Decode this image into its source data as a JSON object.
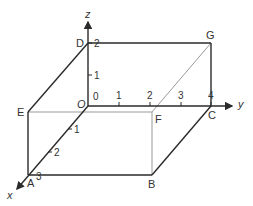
{
  "diagram": {
    "type": "3d-cuboid-axes",
    "axes": {
      "x": {
        "label": "x",
        "ticks": [
          "1",
          "2",
          "3"
        ]
      },
      "y": {
        "label": "y",
        "ticks": [
          "1",
          "2",
          "3",
          "4"
        ]
      },
      "z": {
        "label": "z",
        "ticks": [
          "1",
          "2"
        ]
      },
      "origin_label": "O",
      "origin_tick": "0"
    },
    "vertices": {
      "O": "O",
      "A": "A",
      "B": "B",
      "C": "C",
      "D": "D",
      "E": "E",
      "F": "F",
      "G": "G"
    },
    "colors": {
      "line": "#2a2a2a",
      "thin": "#888888",
      "text": "#333333"
    }
  }
}
